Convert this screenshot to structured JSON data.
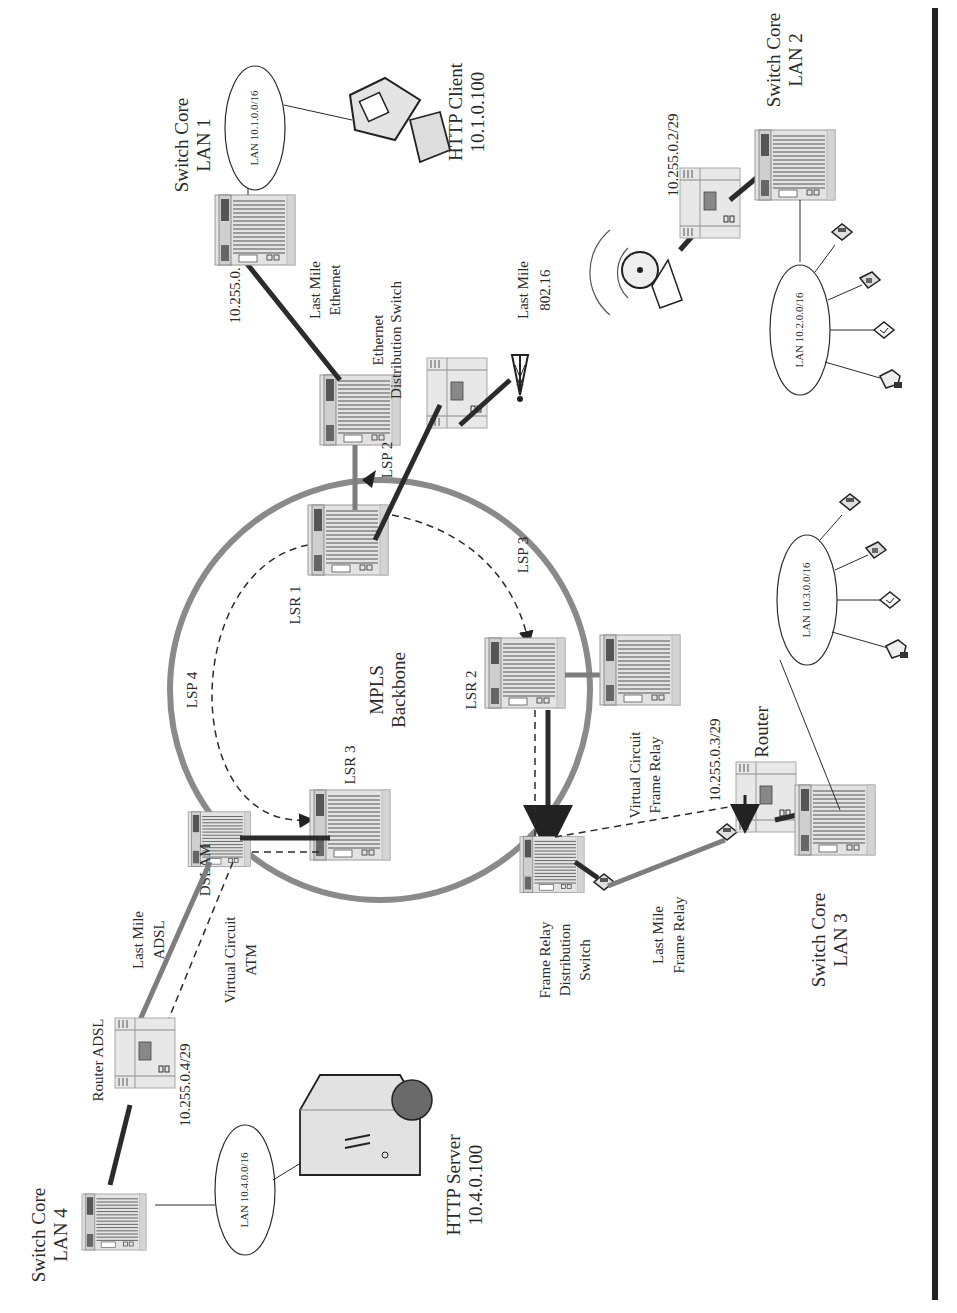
{
  "diagram": {
    "title": "MPLS Backbone",
    "orientation": "rotated-90-ccw",
    "colors": {
      "ring": "#8a8a8a",
      "link_dark": "#2b2b2b",
      "link_gray": "#7d7d7d",
      "device_fill": "#e6e6e6",
      "background": "#ffffff"
    },
    "backbone": {
      "label_line1": "MPLS",
      "label_line2": "Backbone"
    },
    "nodes": {
      "lsr1": {
        "label": "LSR 1"
      },
      "lsr2": {
        "label": "LSR 2"
      },
      "lsr3": {
        "label": "LSR 3"
      },
      "switch_core_lan1": {
        "line1": "Switch Core",
        "line2": "LAN 1"
      },
      "switch_core_lan2": {
        "line1": "Switch Core",
        "line2": "LAN 2"
      },
      "switch_core_lan3": {
        "line1": "Switch Core",
        "line2": "LAN 3"
      },
      "switch_core_lan4": {
        "line1": "Switch Core",
        "line2": "LAN 4"
      },
      "ethernet_dist_switch": {
        "line1": "Ethernet",
        "line2": "Distribution Switch"
      },
      "dslam": {
        "label": "DSLAM"
      },
      "router_adsl": {
        "label": "Router ADSL"
      },
      "router": {
        "label": "Router"
      },
      "frame_relay_dist_switch": {
        "line1": "Frame Relay",
        "line2": "Distribution",
        "line3": "Switch"
      },
      "http_client": {
        "line1": "HTTP Client",
        "line2": "10.1.0.100"
      },
      "http_server": {
        "line1": "HTTP Server",
        "line2": "10.4.0.100"
      }
    },
    "lans": {
      "lan1": "LAN 10.1.0.0/16",
      "lan2": "LAN 10.2.0.0/16",
      "lan3": "LAN 10.3.0.0/16",
      "lan4": "LAN 10.4.0.0/16"
    },
    "addresses": {
      "a1": "10.255.0.1/29",
      "a2": "10.255.0.2/29",
      "a3": "10.255.0.3/29",
      "a4": "10.255.0.4/29"
    },
    "links": {
      "last_mile_ethernet": {
        "line1": "Last Mile",
        "line2": "Ethernet"
      },
      "last_mile_80216": {
        "line1": "Last Mile",
        "line2": "802.16"
      },
      "last_mile_adsl": {
        "line1": "Last Mile",
        "line2": "ADSL"
      },
      "last_mile_frame_relay": {
        "line1": "Last Mile",
        "line2": "Frame Relay"
      },
      "vc_atm": {
        "line1": "Virtual Circuit",
        "line2": "ATM"
      },
      "vc_frame_relay": {
        "line1": "Virtual Circuit",
        "line2": "Frame Relay"
      }
    },
    "lsps": {
      "lsp2": "LSP 2",
      "lsp3": "LSP 3",
      "lsp4": "LSP 4"
    },
    "icons": {
      "device": "switch-rack-icon",
      "pc": "desktop-computer-icon",
      "server": "web-server-icon",
      "dish": "satellite-dish-icon",
      "tower": "radio-tower-icon",
      "phone": "telephone-icon",
      "fax": "fax-icon",
      "printer": "printer-icon",
      "modem": "modem-icon",
      "csu": "csu-dsu-icon"
    }
  }
}
